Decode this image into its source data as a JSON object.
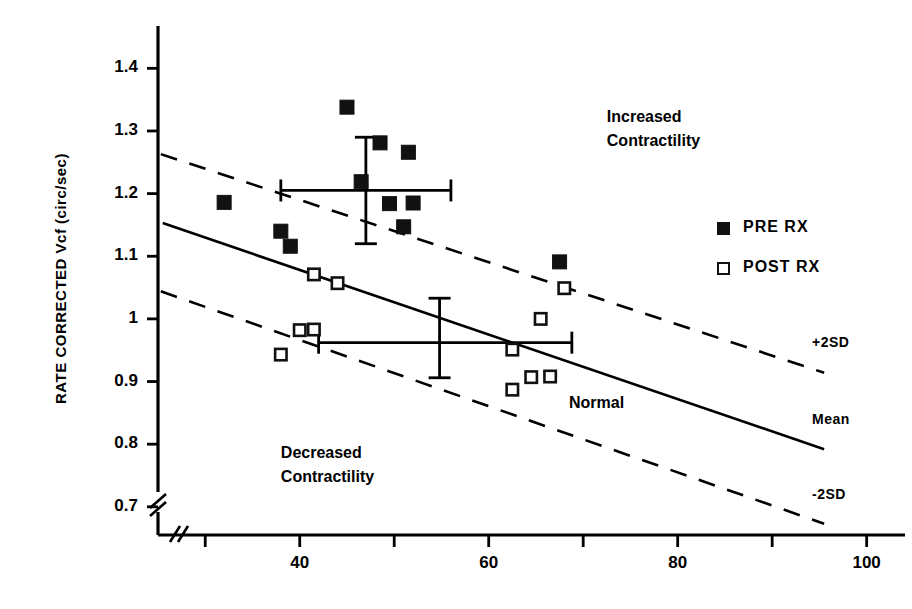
{
  "chart_data": {
    "type": "scatter",
    "title": "",
    "xlabel": "",
    "ylabel": "RATE CORRECTED Vcf (circ/sec)",
    "xlim": [
      25,
      103
    ],
    "ylim": [
      0.655,
      1.45
    ],
    "xticks": [
      30,
      40,
      50,
      60,
      70,
      80,
      90,
      100
    ],
    "xtick_labels": [
      "",
      "40",
      "",
      "60",
      "",
      "80",
      "",
      "100"
    ],
    "yticks": [
      0.7,
      0.8,
      0.9,
      1.0,
      1.1,
      1.2,
      1.3,
      1.4
    ],
    "ytick_labels": [
      "0.7",
      "0.8",
      "0.9",
      "1",
      "1.1",
      "1.2",
      "1.3",
      "1.4"
    ],
    "grid": false,
    "axis_break": true,
    "legend_position": "right",
    "series": [
      {
        "name": "PRE RX",
        "marker": "filled-square",
        "color": "#111111",
        "points": [
          {
            "x": 45.0,
            "y": 1.338
          },
          {
            "x": 32.0,
            "y": 1.186
          },
          {
            "x": 48.5,
            "y": 1.281
          },
          {
            "x": 51.5,
            "y": 1.266
          },
          {
            "x": 46.5,
            "y": 1.219
          },
          {
            "x": 38.0,
            "y": 1.14
          },
          {
            "x": 39.0,
            "y": 1.116
          },
          {
            "x": 49.5,
            "y": 1.184
          },
          {
            "x": 52.0,
            "y": 1.185
          },
          {
            "x": 51.0,
            "y": 1.147
          },
          {
            "x": 67.5,
            "y": 1.091
          }
        ]
      },
      {
        "name": "POST RX",
        "marker": "open-square",
        "color": "#111111",
        "points": [
          {
            "x": 41.5,
            "y": 1.071
          },
          {
            "x": 44.0,
            "y": 1.057
          },
          {
            "x": 68.0,
            "y": 1.049
          },
          {
            "x": 65.5,
            "y": 1.0
          },
          {
            "x": 40.0,
            "y": 0.982
          },
          {
            "x": 41.5,
            "y": 0.983
          },
          {
            "x": 62.5,
            "y": 0.951
          },
          {
            "x": 38.0,
            "y": 0.943
          },
          {
            "x": 64.5,
            "y": 0.907
          },
          {
            "x": 66.5,
            "y": 0.908
          },
          {
            "x": 62.5,
            "y": 0.887
          }
        ]
      }
    ],
    "error_bars": [
      {
        "series": "PRE RX",
        "x": 47.0,
        "y": 1.205,
        "x_low": 38.0,
        "x_high": 56.0,
        "y_low": 1.12,
        "y_high": 1.29
      },
      {
        "series": "POST RX",
        "x": 54.8,
        "y": 0.962,
        "x_low": 42.0,
        "x_high": 68.8,
        "y_low": 0.906,
        "y_high": 1.033
      }
    ],
    "reference_lines": [
      {
        "label": "+2SD",
        "style": "dashed",
        "x_start": 25.3,
        "y_start": 1.263,
        "x_end": 95.5,
        "y_end": 0.914
      },
      {
        "label": "Mean",
        "style": "solid",
        "x_start": 25.5,
        "y_start": 1.153,
        "x_end": 95.5,
        "y_end": 0.792
      },
      {
        "label": "-2SD",
        "style": "dashed",
        "x_start": 25.3,
        "y_start": 1.044,
        "x_end": 95.5,
        "y_end": 0.673
      }
    ],
    "annotations": [
      {
        "name": "increased-contractility",
        "lines": [
          "Increased",
          "Contractility"
        ],
        "x": 72.5,
        "y": 1.323
      },
      {
        "name": "decreased-contractility",
        "lines": [
          "Decreased",
          "Contractility"
        ],
        "x": 38.0,
        "y": 0.786
      },
      {
        "name": "normal",
        "lines": [
          "Normal"
        ],
        "x": 68.5,
        "y": 0.866
      }
    ]
  },
  "legend": {
    "items": [
      {
        "label": "PRE RX",
        "marker": "filled-square"
      },
      {
        "label": "POST RX",
        "marker": "open-square"
      }
    ]
  }
}
